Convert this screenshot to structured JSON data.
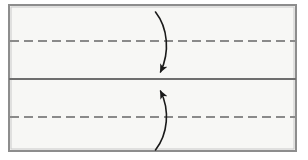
{
  "figure": {
    "type": "paper-folding-instruction-diagram",
    "title": "",
    "caption": "",
    "canvas": {
      "width": 308,
      "height": 160
    },
    "background_color": "#ffffff"
  },
  "colors": {
    "paper_fill": "#f7f7f5",
    "paper_border": "#8d8d8d",
    "paper_border_highlight": "#c9c9c9",
    "center_line": "#6e6e6e",
    "crease_dash": "#8a8a8a",
    "arrow": "#1a1a1a",
    "page_background": "#ffffff"
  },
  "sheet": {
    "name": "paper-sheet",
    "x": 8,
    "y": 4,
    "width": 289,
    "height": 148,
    "border_width": 2,
    "fill": "#f7f7f5"
  },
  "center_line": {
    "name": "center-fold-line",
    "style": "solid",
    "y": 79,
    "x1": 9,
    "x2": 296,
    "stroke_width": 2.2,
    "color": "#6e6e6e",
    "label": "center line"
  },
  "panels": [
    {
      "id": "top-panel",
      "label": "top half",
      "y_top": 5,
      "y_bottom": 79,
      "crease": {
        "name": "crease-line-top",
        "style": "dashed",
        "y": 41,
        "x1": 10,
        "x2": 295,
        "stroke_width": 2,
        "dash": "9 5",
        "color": "#8a8a8a",
        "label": "fold line"
      }
    },
    {
      "id": "bottom-panel",
      "label": "bottom half",
      "y_top": 79,
      "y_bottom": 151,
      "crease": {
        "name": "crease-line-bottom",
        "style": "dashed",
        "y": 117,
        "x1": 10,
        "x2": 295,
        "stroke_width": 2,
        "dash": "9 5",
        "color": "#8a8a8a",
        "label": "fold line"
      }
    }
  ],
  "arrows": [
    {
      "id": "fold-arrow-down",
      "name": "fold-arrow-down",
      "direction": "down",
      "label": "fold top edge down to center line",
      "path": "M 155.5 12 C 168 28, 170 52, 160.5 72",
      "tail": {
        "x": 155.5,
        "y": 12
      },
      "head": {
        "x": 160.5,
        "y": 78
      },
      "head_angle_deg": 112,
      "stroke_width": 1.6,
      "color": "#1a1a1a"
    },
    {
      "id": "fold-arrow-up",
      "name": "fold-arrow-up",
      "direction": "up",
      "label": "fold bottom edge up to center line",
      "path": "M 155.5 150 C 168 134, 170 110, 160.5 91",
      "tail": {
        "x": 155.5,
        "y": 150
      },
      "head": {
        "x": 160.5,
        "y": 85
      },
      "head_angle_deg": 248,
      "stroke_width": 1.6,
      "color": "#1a1a1a"
    }
  ]
}
